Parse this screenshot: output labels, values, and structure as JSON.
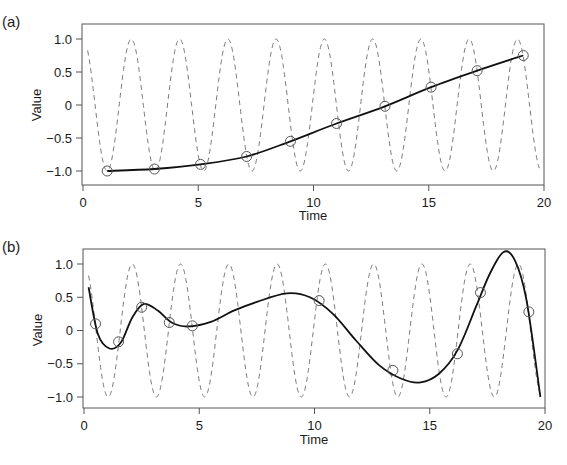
{
  "chart_data": [
    {
      "panel": "(a)",
      "type": "line",
      "xlabel": "Time",
      "ylabel": "Value",
      "xlim": [
        0,
        20
      ],
      "ylim": [
        -1.2,
        1.2
      ],
      "xticks": [
        0,
        5,
        10,
        15,
        20
      ],
      "yticks": [
        -1.0,
        -0.5,
        0,
        0.5,
        1.0
      ],
      "xtick_labels": [
        "0",
        "5",
        "10",
        "15",
        "20"
      ],
      "ytick_labels": [
        "−1.0",
        "−0.5",
        "0",
        "0.5",
        "1.0"
      ],
      "grid": false,
      "series": [
        {
          "name": "signal",
          "style": "dashed",
          "color": "#777777",
          "function": "cos(3t)",
          "t_range": [
            0.2,
            19.8
          ]
        },
        {
          "name": "samples",
          "style": "circles",
          "color": "#555555",
          "x": [
            1.05,
            3.1,
            5.1,
            7.1,
            9.0,
            11.0,
            13.1,
            15.1,
            17.1,
            19.1
          ],
          "y": [
            -1.0,
            -0.97,
            -0.9,
            -0.78,
            -0.55,
            -0.28,
            -0.02,
            0.27,
            0.52,
            0.75
          ]
        },
        {
          "name": "reconstruction",
          "style": "solid",
          "color": "#111111",
          "x": [
            1.05,
            3.1,
            5.1,
            7.1,
            9.0,
            11.0,
            13.1,
            15.1,
            17.1,
            19.1
          ],
          "y": [
            -1.0,
            -0.97,
            -0.9,
            -0.78,
            -0.55,
            -0.28,
            -0.02,
            0.27,
            0.52,
            0.75
          ]
        }
      ]
    },
    {
      "panel": "(b)",
      "type": "line",
      "xlabel": "Time",
      "ylabel": "Value",
      "xlim": [
        0,
        20
      ],
      "ylim": [
        -1.2,
        1.2
      ],
      "xticks": [
        0,
        5,
        10,
        15,
        20
      ],
      "yticks": [
        -1.0,
        -0.5,
        0,
        0.5,
        1.0
      ],
      "xtick_labels": [
        "0",
        "5",
        "10",
        "15",
        "20"
      ],
      "ytick_labels": [
        "−1.0",
        "−0.5",
        "0",
        "0.5",
        "1.0"
      ],
      "grid": false,
      "series": [
        {
          "name": "signal",
          "style": "dashed",
          "color": "#777777",
          "function": "cos(3t)",
          "t_range": [
            0.2,
            19.8
          ]
        },
        {
          "name": "samples",
          "style": "circles",
          "color": "#555555",
          "x": [
            0.5,
            1.5,
            2.5,
            3.7,
            4.7,
            10.2,
            13.4,
            16.2,
            17.2,
            19.3
          ],
          "y": [
            0.1,
            -0.17,
            0.35,
            0.12,
            0.07,
            0.45,
            -0.6,
            -0.35,
            0.57,
            0.28
          ]
        },
        {
          "name": "reconstruction",
          "style": "solid",
          "color": "#111111",
          "x": [
            0.2,
            0.6,
            1.1,
            1.6,
            2.1,
            2.6,
            3.2,
            3.8,
            4.5,
            5.5,
            6.5,
            7.5,
            8.8,
            9.8,
            10.8,
            11.8,
            12.8,
            13.8,
            14.6,
            15.4,
            16.2,
            17.0,
            17.6,
            18.2,
            18.7,
            19.2,
            19.8
          ],
          "y": [
            0.65,
            -0.05,
            -0.27,
            -0.18,
            0.2,
            0.4,
            0.3,
            0.12,
            0.06,
            0.13,
            0.3,
            0.43,
            0.56,
            0.5,
            0.25,
            -0.15,
            -0.52,
            -0.73,
            -0.78,
            -0.65,
            -0.3,
            0.35,
            0.85,
            1.18,
            1.05,
            0.45,
            -1.0
          ]
        }
      ]
    }
  ],
  "panels": {
    "a": {
      "label": "(a)",
      "xlabel": "Time",
      "ylabel": "Value"
    },
    "b": {
      "label": "(b)",
      "xlabel": "Time",
      "ylabel": "Value"
    }
  },
  "ticks": {
    "x": [
      "0",
      "5",
      "10",
      "15",
      "20"
    ],
    "y": [
      "−1.0",
      "−0.5",
      "0",
      "0.5",
      "1.0"
    ]
  }
}
